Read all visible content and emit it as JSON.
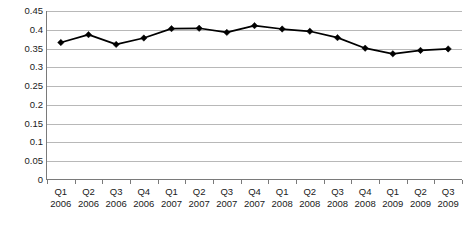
{
  "chart_data": {
    "type": "line",
    "title": "",
    "subtitle": "",
    "xlabel": "",
    "ylabel": "",
    "categories": [
      "Q1 2006",
      "Q2 2006",
      "Q3 2006",
      "Q4 2006",
      "Q1 2007",
      "Q2 2007",
      "Q3 2007",
      "Q4 2007",
      "Q1 2008",
      "Q2 2008",
      "Q3 2008",
      "Q4 2008",
      "Q1 2009",
      "Q2 2009",
      "Q3 2009"
    ],
    "category_quarters": [
      "Q1",
      "Q2",
      "Q3",
      "Q4",
      "Q1",
      "Q2",
      "Q3",
      "Q4",
      "Q1",
      "Q2",
      "Q3",
      "Q4",
      "Q1",
      "Q2",
      "Q3"
    ],
    "category_years": [
      "2006",
      "2006",
      "2006",
      "2006",
      "2007",
      "2007",
      "2007",
      "2007",
      "2008",
      "2008",
      "2008",
      "2008",
      "2009",
      "2009",
      "2009"
    ],
    "values": [
      0.366,
      0.387,
      0.361,
      0.378,
      0.403,
      0.404,
      0.393,
      0.411,
      0.402,
      0.396,
      0.379,
      0.351,
      0.336,
      0.345,
      0.349
    ],
    "ylim": [
      0,
      0.45
    ],
    "ytick_step": 0.05,
    "ytick_labels": [
      "0.45",
      "0.4",
      "0.35",
      "0.3",
      "0.25",
      "0.2",
      "0.15",
      "0.1",
      "0.05",
      "0"
    ],
    "ytick_values": [
      0.45,
      0.4,
      0.35,
      0.3,
      0.25,
      0.2,
      0.15,
      0.1,
      0.05,
      0
    ],
    "grid": true,
    "grid_axis": "y",
    "legend": false,
    "legend_position": "none",
    "series": [
      {
        "name": "",
        "marker": "diamond",
        "color": "#000000",
        "values": [
          0.366,
          0.387,
          0.361,
          0.378,
          0.403,
          0.404,
          0.393,
          0.411,
          0.402,
          0.396,
          0.379,
          0.351,
          0.336,
          0.345,
          0.349
        ]
      }
    ]
  },
  "style": {
    "grid_color": "#b8b8b8",
    "axis_color": "#7a7a7a",
    "text_color": "#1a1a1a",
    "series_color": "#000000",
    "background": "#ffffff"
  }
}
